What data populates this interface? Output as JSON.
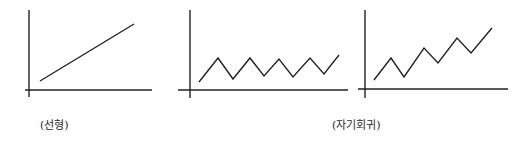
{
  "labels": {
    "linear": "(선형)",
    "autoregressive": "(자기회귀)"
  },
  "colors": {
    "stroke": "#222222",
    "background": "#ffffff"
  },
  "chart_data": [
    {
      "type": "line",
      "title": "",
      "caption": "(선형)",
      "xlabel": "",
      "ylabel": "",
      "grid": false,
      "series": [
        {
          "name": "linear trend",
          "points": [
            [
              40,
              81
            ],
            [
              134,
              24
            ]
          ]
        }
      ]
    },
    {
      "type": "line",
      "title": "",
      "caption": "",
      "xlabel": "",
      "ylabel": "",
      "grid": false,
      "series": [
        {
          "name": "stationary oscillation",
          "points": [
            [
              199,
              82
            ],
            [
              218,
              58
            ],
            [
              233,
              79
            ],
            [
              250,
              58
            ],
            [
              264,
              76
            ],
            [
              279,
              59
            ],
            [
              293,
              77
            ],
            [
              310,
              58
            ],
            [
              324,
              74
            ],
            [
              339,
              55
            ]
          ]
        }
      ]
    },
    {
      "type": "line",
      "title": "",
      "caption": "(자기회귀)",
      "xlabel": "",
      "ylabel": "",
      "grid": false,
      "series": [
        {
          "name": "autoregressive upward oscillation",
          "points": [
            [
              374,
              80
            ],
            [
              391,
              58
            ],
            [
              404,
              77
            ],
            [
              424,
              48
            ],
            [
              438,
              63
            ],
            [
              457,
              38
            ],
            [
              471,
              53
            ],
            [
              492,
              28
            ]
          ]
        }
      ]
    }
  ]
}
